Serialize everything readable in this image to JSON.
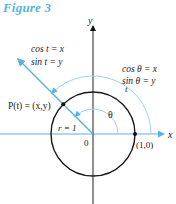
{
  "figure": {
    "title": "Figure 3"
  },
  "labels": {
    "y_axis": "y",
    "x_axis": "x",
    "origin": "0",
    "point_one_zero": "(1,0)",
    "point_p": "P(t) = (x,y)",
    "radius": "r = 1",
    "theta": "θ",
    "t": "t",
    "left_cos": "cos t = x",
    "left_sin": "sin t = y",
    "right_cos": "cos θ = x",
    "right_sin": "sin θ = y"
  },
  "colors": {
    "accent": "#5ab3de",
    "axis": "#222222",
    "circle": "#1a1a1a",
    "arc": "#9fd2ea"
  },
  "geometry": {
    "origin": [
      93,
      134
    ],
    "unit_radius": 42,
    "angle_deg": 135,
    "theta_arc_radius": 25,
    "t_arc_radius": 58
  }
}
